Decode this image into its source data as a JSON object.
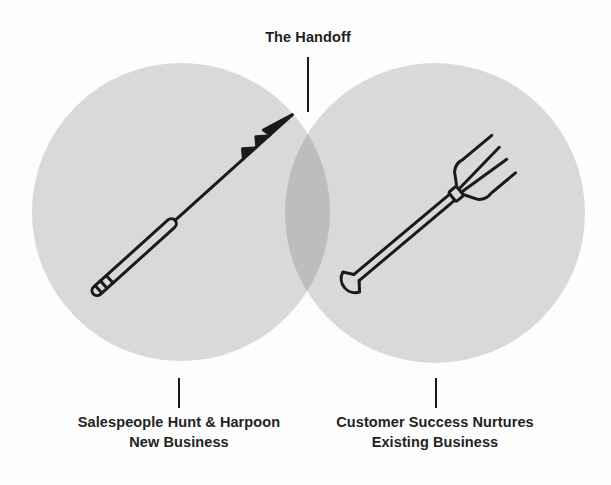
{
  "diagram": {
    "type": "venn",
    "colors": {
      "background": "#fdfdfd",
      "circle_fill": "#d9d9d9",
      "overlap_fill": "#bdbdbd",
      "stroke": "#1a1a1a"
    },
    "top_label": "The Handoff",
    "left": {
      "icon": "harpoon-icon",
      "label_line1": "Salespeople Hunt & Harpoon",
      "label_line2": "New Business"
    },
    "right": {
      "icon": "pitchfork-icon",
      "label_line1": "Customer Success Nurtures",
      "label_line2": "Existing Business"
    }
  }
}
